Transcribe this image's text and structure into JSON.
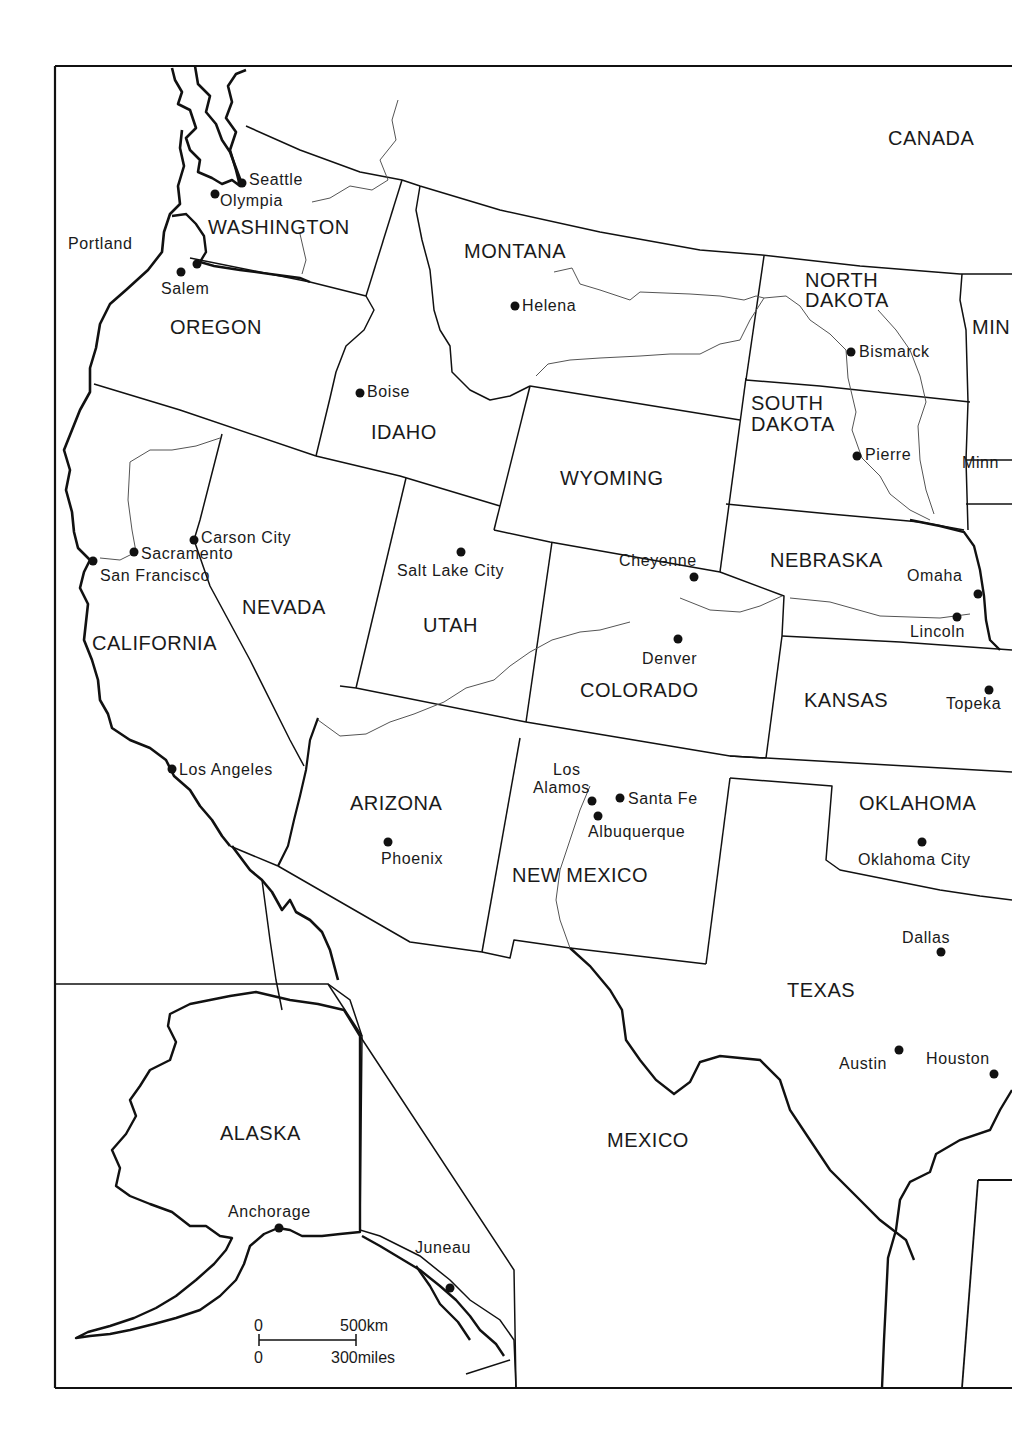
{
  "map": {
    "type": "political outline map",
    "region": "Western United States with Alaska inset",
    "colors": {
      "ink": "#111111",
      "paper": "#ffffff",
      "river": "#555555"
    }
  },
  "countries": [
    {
      "id": "canada",
      "label": "CANADA"
    },
    {
      "id": "mexico",
      "label": "MEXICO"
    }
  ],
  "states": [
    {
      "id": "washington",
      "label": "WASHINGTON"
    },
    {
      "id": "oregon",
      "label": "OREGON"
    },
    {
      "id": "california",
      "label": "CALIFORNIA"
    },
    {
      "id": "nevada",
      "label": "NEVADA"
    },
    {
      "id": "idaho",
      "label": "IDAHO"
    },
    {
      "id": "montana",
      "label": "MONTANA"
    },
    {
      "id": "wyoming",
      "label": "WYOMING"
    },
    {
      "id": "utah",
      "label": "UTAH"
    },
    {
      "id": "arizona",
      "label": "ARIZONA"
    },
    {
      "id": "colorado",
      "label": "COLORADO"
    },
    {
      "id": "new-mexico",
      "label": "NEW MEXICO"
    },
    {
      "id": "north-dakota-1",
      "label": "NORTH"
    },
    {
      "id": "north-dakota-2",
      "label": "DAKOTA"
    },
    {
      "id": "south-dakota-1",
      "label": "SOUTH"
    },
    {
      "id": "south-dakota-2",
      "label": "DAKOTA"
    },
    {
      "id": "nebraska",
      "label": "NEBRASKA"
    },
    {
      "id": "kansas",
      "label": "KANSAS"
    },
    {
      "id": "oklahoma",
      "label": "OKLAHOMA"
    },
    {
      "id": "texas",
      "label": "TEXAS"
    },
    {
      "id": "alaska",
      "label": "ALASKA"
    },
    {
      "id": "minnesota-partial",
      "label": "MIN"
    }
  ],
  "cities": [
    {
      "id": "seattle",
      "label": "Seattle"
    },
    {
      "id": "olympia",
      "label": "Olympia"
    },
    {
      "id": "portland",
      "label": "Portland"
    },
    {
      "id": "salem",
      "label": "Salem"
    },
    {
      "id": "helena",
      "label": "Helena"
    },
    {
      "id": "bismarck",
      "label": "Bismarck"
    },
    {
      "id": "pierre",
      "label": "Pierre"
    },
    {
      "id": "minneapolis-partial",
      "label": "Minn"
    },
    {
      "id": "boise",
      "label": "Boise"
    },
    {
      "id": "carson-city",
      "label": "Carson City"
    },
    {
      "id": "sacramento",
      "label": "Sacramento"
    },
    {
      "id": "san-francisco",
      "label": "San Francisco"
    },
    {
      "id": "salt-lake-city",
      "label": "Salt Lake City"
    },
    {
      "id": "cheyenne",
      "label": "Cheyenne"
    },
    {
      "id": "omaha",
      "label": "Omaha"
    },
    {
      "id": "lincoln",
      "label": "Lincoln"
    },
    {
      "id": "denver",
      "label": "Denver"
    },
    {
      "id": "topeka",
      "label": "Topeka"
    },
    {
      "id": "los-angeles",
      "label": "Los Angeles"
    },
    {
      "id": "los-alamos-1",
      "label": "Los"
    },
    {
      "id": "los-alamos-2",
      "label": "Alamos"
    },
    {
      "id": "santa-fe",
      "label": "Santa Fe"
    },
    {
      "id": "albuquerque",
      "label": "Albuquerque"
    },
    {
      "id": "phoenix",
      "label": "Phoenix"
    },
    {
      "id": "oklahoma-city",
      "label": "Oklahoma City"
    },
    {
      "id": "dallas",
      "label": "Dallas"
    },
    {
      "id": "austin",
      "label": "Austin"
    },
    {
      "id": "houston",
      "label": "Houston"
    },
    {
      "id": "anchorage",
      "label": "Anchorage"
    },
    {
      "id": "juneau",
      "label": "Juneau"
    }
  ],
  "scale_bar": {
    "km_zero": "0",
    "km_label": "500km",
    "miles_zero": "0",
    "miles_label": "300miles"
  }
}
